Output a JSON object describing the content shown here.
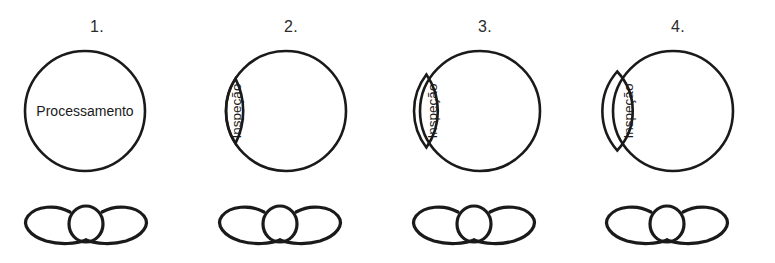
{
  "figure": {
    "type": "process-stage-diagram",
    "background_color": "#ffffff",
    "stroke_color": "#1a1a1a",
    "panel_count": 4
  },
  "panels": [
    {
      "number": "1.",
      "circle_label": "Processamento",
      "crescent_label": "",
      "crescent_visible": false,
      "crescent_width_px": 0,
      "wing_symbol": "wing-nut-symbol"
    },
    {
      "number": "2.",
      "circle_label": "",
      "crescent_label": "Inspeção",
      "crescent_visible": true,
      "crescent_width_px": 30,
      "wing_symbol": "wing-nut-symbol"
    },
    {
      "number": "3.",
      "circle_label": "",
      "crescent_label": "Inspeção",
      "crescent_visible": true,
      "crescent_width_px": 38,
      "wing_symbol": "wing-nut-symbol"
    },
    {
      "number": "4.",
      "circle_label": "",
      "crescent_label": "Inspeção",
      "crescent_visible": true,
      "crescent_width_px": 46,
      "wing_symbol": "wing-nut-symbol"
    }
  ]
}
